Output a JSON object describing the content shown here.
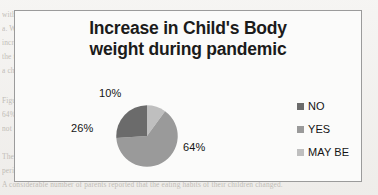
{
  "page": {
    "background_color": "#f2f1ef",
    "ghost_text_color": "#b9b5ae",
    "ghost_lines": [
      "with their respective parents, it has been observed that 17% of children has potential impact on",
      "a. Weight gain of the child, 23% response shows that the no. of children had their health issues",
      "increased when it came to tackle the pandemic. It outlined in duration over the given time",
      "the type of the kids and their activity related to the sleeping patterns. The average health of",
      "a child. In few cases, the screen time of children has also reduced from the routine.",
      "Figure 4.1 represents the data about the increase in a child's body weight during the pandemic,",
      "64% of the children stated that they experienced an increase in their weight, whereas 26% have",
      "not observed any significant gain in body weight, and 10% were not sure about it.",
      "The analysis also showed that children were found to be more attached to digital devices in this",
      "period, which made the parents concerned about the long term effects on vision and posture.",
      "A considerable number of parents reported that the eating habits of their children changed."
    ]
  },
  "chart": {
    "frame_border_color": "#9b9b9b",
    "plot_background": "#fbfbfa",
    "title_line_1": "Increase in Child's Body",
    "title_line_2": "weight during pandemic"
  },
  "chart_data": {
    "type": "pie",
    "title": "Increase in Child's Body weight during pandemic",
    "xlabel": "",
    "ylabel": "",
    "categories": [
      "NO",
      "YES",
      "MAY BE"
    ],
    "values": [
      26,
      64,
      10
    ],
    "value_labels": [
      "26%",
      "64%",
      "10%"
    ],
    "colors": [
      "#6b6b6b",
      "#9a9a9a",
      "#bfbfbf"
    ],
    "legend": {
      "position": "right",
      "entries": [
        {
          "label": "NO",
          "color": "#6b6b6b"
        },
        {
          "label": "YES",
          "color": "#9a9a9a"
        },
        {
          "label": "MAY BE",
          "color": "#bfbfbf"
        }
      ]
    },
    "slices": [
      {
        "label": "MAY BE",
        "value": 10,
        "display": "10%",
        "color": "#bfbfbf",
        "start_angle_deg": 0,
        "end_angle_deg": 36
      },
      {
        "label": "YES",
        "value": 64,
        "display": "64%",
        "color": "#9a9a9a",
        "start_angle_deg": 36,
        "end_angle_deg": 266.4
      },
      {
        "label": "NO",
        "value": 26,
        "display": "26%",
        "color": "#6b6b6b",
        "start_angle_deg": 266.4,
        "end_angle_deg": 360
      }
    ],
    "start_angle_note": "clockwise from 12 o'clock",
    "grid": false
  }
}
